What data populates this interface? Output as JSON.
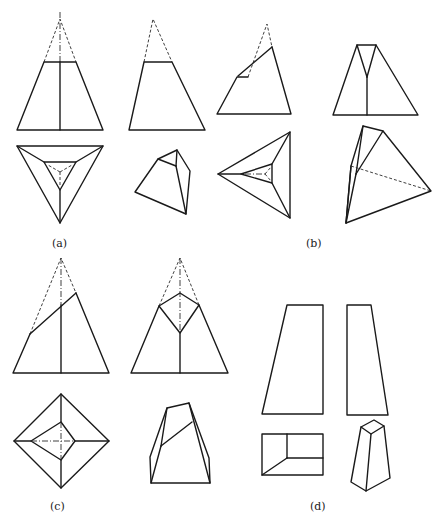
{
  "figure": {
    "panels": [
      {
        "id": "a",
        "label": "(a)",
        "views": [
          "front-view",
          "side-view",
          "top-view",
          "isometric-view"
        ],
        "description": "Triangular pyramid truncated by horizontal plane"
      },
      {
        "id": "b",
        "label": "(b)",
        "views": [
          "front-view",
          "side-view",
          "top-view",
          "isometric-view"
        ],
        "description": "Triangular pyramid truncated by inclined plane"
      },
      {
        "id": "c",
        "label": "(c)",
        "views": [
          "front-view",
          "side-view",
          "top-view",
          "isometric-view"
        ],
        "description": "Square pyramid truncated by inclined plane"
      },
      {
        "id": "d",
        "label": "(d)",
        "views": [
          "front-view",
          "side-view",
          "top-view",
          "isometric-view"
        ],
        "description": "Truncated rectangular prism (frustum)"
      }
    ],
    "line_color": "#1a1a1a",
    "background": "#ffffff"
  }
}
